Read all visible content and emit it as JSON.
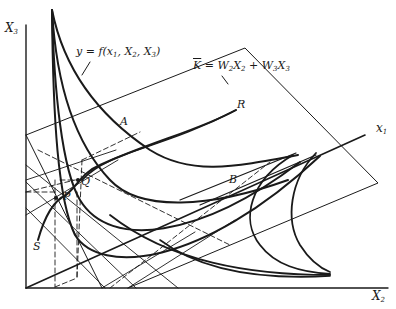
{
  "diagram": {
    "type": "3d-production-isoquant-diagram",
    "axes": {
      "vertical": {
        "label": "X",
        "subscript": "3"
      },
      "horizontal": {
        "label": "X",
        "subscript": "2"
      },
      "diagonal": {
        "label": "x",
        "subscript": "1"
      }
    },
    "annotations": {
      "function_label": {
        "lhs": "y",
        "eq": " = ",
        "fn": "f(x",
        "s1": "1",
        "mid1": ", X",
        "s2": "2",
        "mid2": ", X",
        "s3": "3",
        "close": ")"
      },
      "cost_plane_label": {
        "lhs": "K",
        "eq": " = W",
        "s2": "2",
        "mid": "X",
        "s2b": "2",
        "plus": " + W",
        "s3": "3",
        "mid2": "X",
        "s3b": "3"
      }
    },
    "points": {
      "A": "A",
      "B": "B",
      "R": "R",
      "Q": "Q",
      "P": "P",
      "S": "S"
    },
    "colors": {
      "ink": "#1a1a1a",
      "background": "#ffffff"
    }
  }
}
